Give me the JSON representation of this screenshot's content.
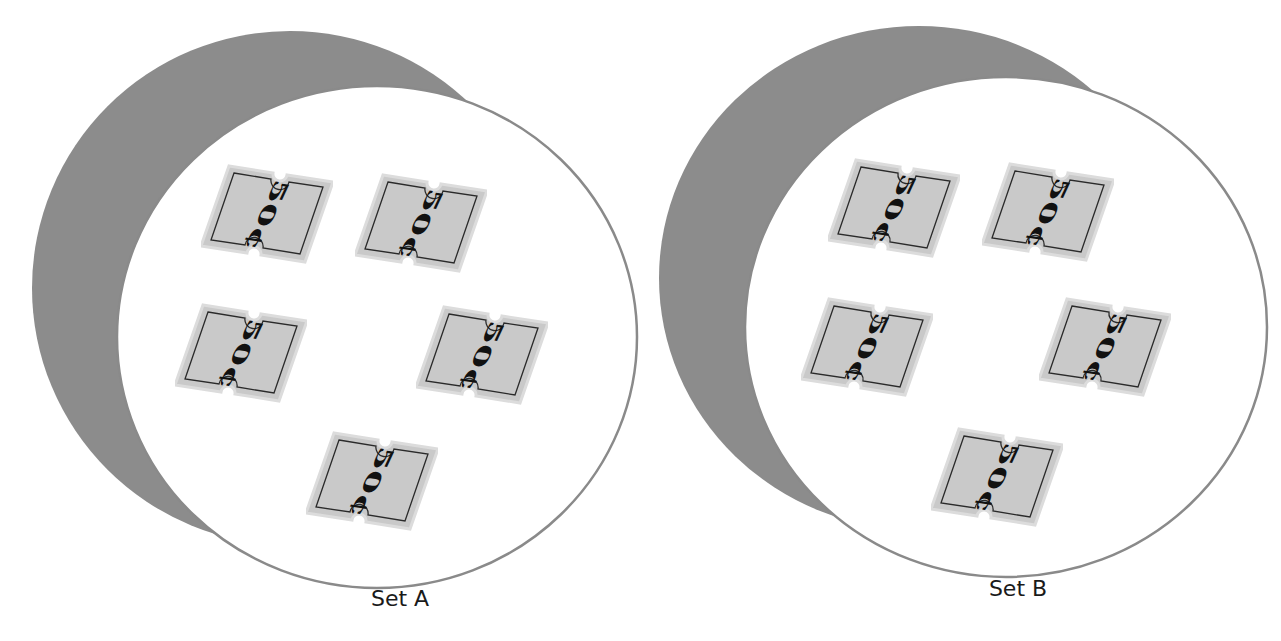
{
  "figure": {
    "background": "#ffffff",
    "shadow_color": "#8c8c8c",
    "circle_fill": "#ffffff",
    "circle_stroke": "#8a8a8a",
    "ticket_fill": "#c9c9c9",
    "ticket_edge": "#dcdcdc",
    "ticket_border": "#2a2a2a",
    "ticket_text_color": "#111111"
  },
  "sets": [
    {
      "label": "Set A",
      "label_pos": [
        400,
        600
      ],
      "shadow": {
        "cx": 290,
        "cy": 288,
        "rx": 258,
        "ry": 257
      },
      "circle": {
        "cx": 377,
        "cy": 337,
        "rx": 260,
        "ry": 251
      },
      "tickets": [
        {
          "value": "50¢",
          "center": [
            267,
            214
          ]
        },
        {
          "value": "50¢",
          "center": [
            421,
            223
          ]
        },
        {
          "value": "50¢",
          "center": [
            241,
            353
          ]
        },
        {
          "value": "50¢",
          "center": [
            482,
            355
          ]
        },
        {
          "value": "50¢",
          "center": [
            372,
            481
          ]
        }
      ]
    },
    {
      "label": "Set B",
      "label_pos": [
        1018,
        590
      ],
      "shadow": {
        "cx": 919,
        "cy": 278,
        "rx": 260,
        "ry": 252
      },
      "circle": {
        "cx": 1006,
        "cy": 327,
        "rx": 261,
        "ry": 250
      },
      "tickets": [
        {
          "value": "50¢",
          "center": [
            894,
            208
          ]
        },
        {
          "value": "50¢",
          "center": [
            1048,
            212
          ]
        },
        {
          "value": "50¢",
          "center": [
            867,
            347
          ]
        },
        {
          "value": "50¢",
          "center": [
            1105,
            347
          ]
        },
        {
          "value": "50¢",
          "center": [
            997,
            477
          ]
        }
      ]
    }
  ]
}
